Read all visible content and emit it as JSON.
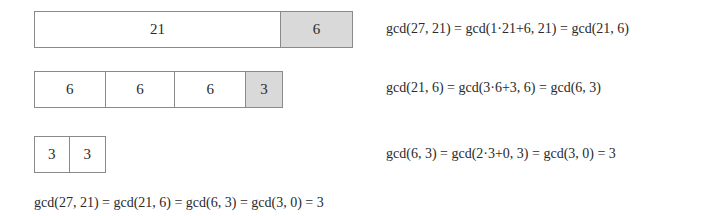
{
  "rows": [
    {
      "cells": [
        {
          "label": "21",
          "width": 247,
          "remainder": false
        },
        {
          "label": "6",
          "width": 71,
          "remainder": true
        }
      ],
      "equation": "gcd(27, 21) = gcd(1·21+6, 21) = gcd(21, 6)"
    },
    {
      "cells": [
        {
          "label": "6",
          "width": 71,
          "remainder": false
        },
        {
          "label": "6",
          "width": 70,
          "remainder": false
        },
        {
          "label": "6",
          "width": 71,
          "remainder": false
        },
        {
          "label": "3",
          "width": 36,
          "remainder": true
        }
      ],
      "equation": "gcd(21, 6) = gcd(3·6+3, 6) = gcd(6, 3)"
    },
    {
      "cells": [
        {
          "label": "3",
          "width": 35,
          "remainder": false
        },
        {
          "label": "3",
          "width": 36,
          "remainder": false
        }
      ],
      "equation": "gcd(6, 3) = gcd(2·3+0, 3) = gcd(3, 0) = 3"
    }
  ],
  "summary": "gcd(27, 21) = gcd(21, 6) = gcd(6, 3) = gcd(3, 0) = 3",
  "colors": {
    "remainder_fill": "#d9d9d9",
    "border": "#8a8a8a"
  }
}
